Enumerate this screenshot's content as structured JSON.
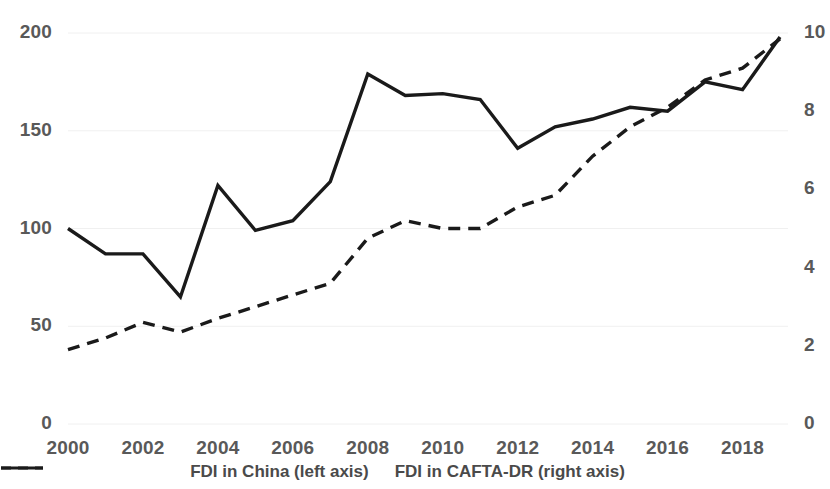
{
  "chart_data": {
    "type": "line",
    "title": "",
    "xlabel": "",
    "ylabel": "",
    "grid": true,
    "legend_position": "bottom",
    "x": [
      2000,
      2001,
      2002,
      2003,
      2004,
      2005,
      2006,
      2007,
      2008,
      2009,
      2010,
      2011,
      2012,
      2013,
      2014,
      2015,
      2016,
      2017,
      2018,
      2019
    ],
    "x_tick_labels": [
      "2000",
      "2002",
      "2004",
      "2006",
      "2008",
      "2010",
      "2012",
      "2014",
      "2016",
      "2018"
    ],
    "x_ticks": [
      2000,
      2002,
      2004,
      2006,
      2008,
      2010,
      2012,
      2014,
      2016,
      2018
    ],
    "xlim": [
      2000,
      2019
    ],
    "left_axis": {
      "label": "FDI in China (left axis)",
      "ylim": [
        0,
        200
      ],
      "ticks": [
        0,
        50,
        100,
        150,
        200
      ],
      "tick_labels": [
        "0",
        "50",
        "100",
        "150",
        "200"
      ]
    },
    "right_axis": {
      "label": "FDI in CAFTA-DR (right axis)",
      "ylim": [
        0,
        10
      ],
      "ticks": [
        0,
        2,
        4,
        6,
        8,
        10
      ],
      "tick_labels": [
        "0",
        "2",
        "4",
        "6",
        "8",
        "10"
      ]
    },
    "series": [
      {
        "name": "FDI in China (left axis)",
        "axis": "left",
        "style": "dashed",
        "color": "#1a1a1a",
        "values": [
          38,
          44,
          52,
          47,
          54,
          60,
          66,
          72,
          95,
          104,
          100,
          100,
          111,
          117,
          137,
          152,
          162,
          176,
          182,
          197
        ]
      },
      {
        "name": "FDI in CAFTA-DR (right axis)",
        "axis": "right",
        "style": "solid",
        "color": "#1a1a1a",
        "values": [
          5.0,
          4.35,
          4.35,
          3.25,
          6.1,
          4.95,
          5.2,
          6.2,
          8.95,
          8.4,
          8.45,
          8.3,
          7.05,
          7.6,
          7.8,
          8.1,
          8.0,
          8.75,
          8.55,
          9.9
        ]
      }
    ]
  },
  "legend": {
    "items": [
      {
        "label": "FDI in China (left axis)",
        "style": "dashed"
      },
      {
        "label": "FDI in CAFTA-DR (right axis)",
        "style": "solid"
      }
    ]
  },
  "colors": {
    "line": "#1a1a1a",
    "grid": "#f0f0f0",
    "tick_text": "#595959",
    "legend_text": "#4a4a4a",
    "background": "#ffffff"
  }
}
